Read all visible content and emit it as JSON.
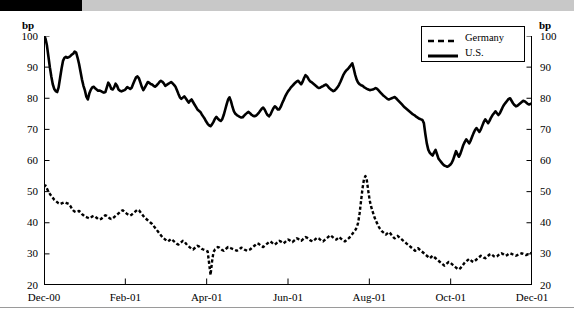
{
  "figure": {
    "unit_label_left": "bp",
    "unit_label_right": "bp",
    "legend": {
      "entries": [
        {
          "label": "Germany",
          "style": "dashed",
          "color": "#000000",
          "icon": "dashed-line-icon"
        },
        {
          "label": "U.S.",
          "style": "solid",
          "color": "#000000",
          "icon": "solid-line-icon"
        }
      ]
    }
  },
  "chart_data": {
    "type": "line",
    "title": "",
    "subtitle": "",
    "xlabel": "",
    "ylabel": "bp",
    "ylabel_right": "bp",
    "ylim": [
      20,
      100
    ],
    "yticks": [
      20,
      30,
      40,
      50,
      60,
      70,
      80,
      90,
      100
    ],
    "ytick_labels": [
      "20",
      "30",
      "40",
      "50",
      "60",
      "70",
      "80",
      "90",
      "100"
    ],
    "xlim": [
      0,
      6
    ],
    "xticks": [
      0,
      1,
      2,
      3,
      4,
      5,
      6
    ],
    "xtick_labels": [
      "Dec-00",
      "Feb-01",
      "Apr-01",
      "Jun-01",
      "Aug-01",
      "Oct-01",
      "Dec-01"
    ],
    "grid": false,
    "legend_position": "top-right",
    "series": [
      {
        "name": "U.S.",
        "style": "solid",
        "color": "#000000",
        "linewidth": 2.6,
        "values": [
          100.0,
          99.2,
          97.0,
          93.5,
          90.0,
          87.0,
          84.5,
          83.0,
          82.3,
          82.0,
          83.5,
          86.5,
          89.5,
          92.0,
          93.0,
          93.3,
          93.0,
          93.2,
          93.5,
          94.0,
          94.3,
          95.0,
          94.7,
          93.0,
          91.0,
          88.5,
          86.0,
          84.0,
          82.5,
          80.5,
          79.6,
          81.5,
          82.7,
          83.5,
          83.7,
          83.2,
          82.8,
          82.4,
          82.5,
          82.3,
          82.0,
          81.8,
          82.0,
          83.5,
          85.0,
          84.3,
          83.0,
          82.8,
          83.5,
          84.7,
          84.0,
          82.8,
          82.4,
          82.2,
          82.4,
          82.6,
          83.0,
          83.6,
          83.3,
          83.0,
          83.4,
          84.6,
          85.7,
          86.7,
          87.0,
          86.4,
          85.0,
          83.6,
          82.6,
          83.4,
          84.3,
          85.2,
          85.0,
          84.6,
          84.4,
          84.0,
          83.7,
          84.1,
          84.6,
          85.2,
          85.6,
          85.3,
          84.8,
          84.0,
          84.3,
          84.6,
          84.9,
          85.2,
          84.8,
          84.3,
          83.7,
          82.6,
          81.4,
          80.3,
          79.8,
          80.2,
          80.6,
          80.0,
          79.3,
          78.6,
          79.2,
          79.6,
          78.8,
          78.0,
          77.2,
          76.4,
          76.0,
          75.6,
          74.8,
          74.1,
          73.4,
          72.5,
          71.8,
          71.3,
          71.0,
          71.6,
          72.4,
          73.4,
          74.0,
          73.4,
          73.0,
          72.7,
          73.3,
          74.6,
          76.3,
          78.0,
          79.6,
          80.3,
          79.0,
          77.2,
          75.8,
          75.0,
          74.6,
          74.3,
          74.0,
          73.8,
          73.9,
          74.4,
          74.9,
          75.3,
          75.6,
          75.2,
          74.7,
          74.4,
          74.2,
          74.4,
          74.8,
          75.3,
          76.0,
          76.6,
          77.0,
          76.4,
          75.4,
          74.6,
          74.2,
          74.8,
          75.8,
          76.8,
          77.4,
          77.0,
          76.4,
          76.4,
          77.2,
          78.4,
          79.4,
          80.5,
          81.4,
          82.2,
          82.8,
          83.5,
          84.0,
          84.5,
          85.0,
          85.4,
          85.6,
          85.0,
          84.5,
          85.3,
          86.5,
          87.4,
          87.0,
          86.2,
          85.5,
          85.2,
          84.8,
          84.4,
          84.0,
          83.6,
          83.3,
          83.4,
          83.7,
          83.9,
          84.2,
          84.4,
          84.0,
          83.4,
          83.0,
          82.6,
          82.3,
          82.5,
          83.0,
          83.6,
          84.4,
          85.4,
          86.5,
          87.6,
          88.4,
          89.0,
          89.4,
          90.0,
          90.6,
          91.2,
          89.5,
          87.5,
          86.0,
          85.0,
          84.5,
          84.2,
          84.0,
          83.6,
          83.3,
          83.0,
          82.8,
          82.6,
          82.7,
          82.8,
          83.0,
          83.3,
          83.0,
          82.5,
          82.0,
          81.5,
          81.0,
          80.6,
          80.2,
          79.8,
          79.6,
          79.8,
          80.0,
          80.2,
          80.4,
          80.0,
          79.5,
          79.0,
          78.5,
          78.0,
          77.5,
          77.0,
          76.6,
          76.2,
          75.8,
          75.4,
          75.0,
          74.7,
          74.4,
          74.0,
          73.7,
          73.4,
          73.2,
          73.0,
          72.0,
          68.5,
          65.5,
          63.5,
          62.5,
          62.0,
          61.6,
          62.6,
          63.4,
          62.0,
          60.6,
          60.0,
          59.4,
          58.8,
          58.4,
          58.2,
          58.0,
          58.2,
          58.6,
          59.2,
          60.2,
          61.6,
          63.0,
          62.0,
          61.2,
          62.2,
          63.6,
          65.0,
          66.0,
          66.8,
          66.2,
          65.5,
          66.4,
          67.6,
          68.8,
          69.8,
          70.4,
          69.8,
          69.2,
          70.0,
          71.2,
          72.4,
          73.2,
          72.6,
          72.0,
          72.8,
          73.8,
          74.6,
          75.2,
          75.8,
          75.2,
          74.6,
          75.2,
          76.2,
          77.2,
          78.0,
          78.6,
          79.2,
          79.8,
          80.0,
          79.2,
          78.4,
          77.8,
          77.4,
          77.6,
          78.0,
          78.4,
          78.8,
          79.2,
          79.0,
          78.6,
          78.2,
          78.0,
          78.2,
          78.4
        ]
      },
      {
        "name": "Germany",
        "style": "dashed",
        "color": "#000000",
        "linewidth": 2.4,
        "values": [
          51.5,
          52.0,
          51.0,
          50.0,
          49.3,
          48.6,
          48.0,
          47.4,
          47.0,
          46.6,
          46.2,
          46.0,
          46.2,
          46.4,
          46.6,
          46.4,
          46.2,
          46.0,
          45.4,
          44.6,
          44.0,
          43.6,
          43.4,
          43.6,
          43.8,
          43.4,
          42.8,
          42.4,
          42.0,
          41.8,
          41.6,
          41.4,
          41.6,
          42.0,
          42.2,
          42.0,
          41.6,
          41.2,
          41.0,
          41.2,
          41.6,
          42.0,
          42.4,
          42.2,
          41.8,
          41.4,
          41.2,
          41.4,
          41.8,
          42.2,
          42.6,
          43.0,
          43.4,
          43.8,
          44.0,
          43.6,
          43.2,
          42.8,
          42.5,
          42.3,
          42.6,
          43.0,
          43.4,
          43.8,
          44.2,
          44.0,
          43.4,
          42.8,
          42.2,
          41.6,
          41.2,
          40.8,
          40.4,
          40.0,
          39.6,
          39.0,
          38.4,
          37.8,
          37.2,
          36.6,
          36.0,
          35.4,
          35.0,
          34.6,
          34.2,
          34.0,
          34.4,
          34.8,
          34.4,
          34.0,
          33.6,
          33.2,
          33.0,
          33.4,
          33.8,
          34.2,
          34.0,
          33.4,
          32.8,
          32.4,
          32.0,
          31.6,
          31.4,
          31.8,
          32.2,
          32.6,
          32.4,
          32.0,
          31.6,
          31.4,
          31.2,
          31.0,
          30.8,
          27.0,
          23.2,
          27.5,
          30.6,
          31.4,
          31.8,
          32.2,
          32.0,
          31.6,
          31.2,
          31.0,
          31.4,
          31.8,
          32.2,
          32.0,
          31.8,
          31.6,
          31.4,
          31.2,
          31.0,
          31.2,
          31.6,
          32.0,
          31.8,
          31.4,
          31.2,
          31.0,
          31.2,
          31.4,
          31.8,
          32.2,
          32.6,
          33.0,
          33.4,
          33.2,
          32.8,
          32.4,
          32.2,
          32.6,
          33.0,
          33.4,
          33.8,
          34.0,
          33.6,
          33.2,
          33.0,
          33.4,
          33.8,
          34.2,
          34.0,
          33.6,
          33.4,
          33.8,
          34.2,
          34.6,
          34.4,
          34.0,
          33.8,
          34.2,
          34.6,
          35.0,
          34.8,
          34.4,
          34.2,
          34.6,
          35.0,
          35.4,
          35.2,
          34.8,
          34.4,
          34.2,
          34.0,
          34.4,
          34.8,
          35.2,
          35.0,
          34.6,
          34.2,
          34.0,
          34.4,
          34.8,
          35.2,
          35.6,
          36.0,
          35.6,
          35.2,
          34.8,
          34.6,
          35.0,
          35.4,
          35.0,
          34.6,
          34.2,
          34.0,
          34.4,
          34.8,
          35.2,
          35.8,
          36.4,
          37.0,
          37.6,
          38.4,
          40.0,
          43.0,
          47.0,
          51.0,
          54.0,
          55.0,
          53.5,
          50.0,
          47.0,
          45.0,
          43.5,
          42.0,
          40.8,
          39.8,
          38.8,
          38.0,
          37.4,
          37.0,
          36.6,
          36.2,
          36.6,
          37.0,
          36.6,
          36.0,
          35.4,
          35.0,
          35.4,
          35.8,
          35.4,
          35.0,
          34.6,
          34.2,
          33.8,
          33.4,
          33.0,
          32.6,
          32.2,
          31.8,
          31.4,
          31.0,
          31.4,
          31.8,
          31.4,
          31.0,
          30.6,
          30.2,
          29.8,
          29.4,
          29.0,
          28.6,
          29.0,
          29.4,
          29.0,
          28.6,
          28.2,
          27.8,
          27.4,
          27.0,
          26.6,
          26.2,
          26.6,
          27.0,
          27.4,
          27.2,
          26.8,
          26.4,
          26.0,
          25.6,
          25.2,
          25.0,
          25.4,
          26.0,
          26.6,
          27.2,
          27.6,
          28.0,
          28.4,
          28.0,
          27.6,
          27.4,
          27.8,
          28.2,
          28.6,
          29.0,
          29.4,
          29.2,
          28.8,
          28.6,
          29.0,
          29.4,
          29.8,
          30.0,
          29.6,
          29.2,
          29.0,
          29.2,
          29.6,
          30.0,
          30.2,
          30.0,
          29.6,
          29.4,
          29.6,
          30.0,
          30.2,
          30.0,
          29.8,
          29.6,
          29.4,
          29.6,
          29.8,
          30.0,
          30.2,
          30.0,
          29.8,
          29.6,
          29.8,
          30.0,
          30.2,
          30.4
        ]
      }
    ]
  }
}
